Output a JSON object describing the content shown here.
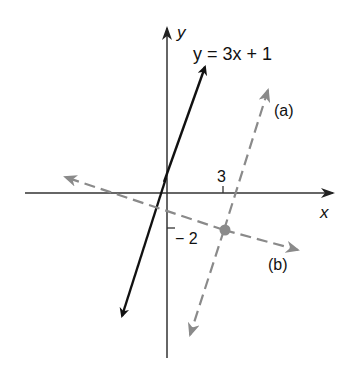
{
  "diagram": {
    "axes": {
      "x_label": "x",
      "y_label": "y"
    },
    "ticks": {
      "x_tick_label": "3",
      "y_tick_label": "− 2"
    },
    "lines": [
      {
        "id": "main",
        "label": "y = 3x + 1",
        "style": "solid",
        "color": "#111111"
      },
      {
        "id": "a",
        "label": "(a)",
        "style": "dashed",
        "color": "#8a8a8a"
      },
      {
        "id": "b",
        "label": "(b)",
        "style": "dashed",
        "color": "#8a8a8a"
      }
    ],
    "point": {
      "x": 3,
      "y": -2,
      "color": "#8a8a8a"
    }
  }
}
